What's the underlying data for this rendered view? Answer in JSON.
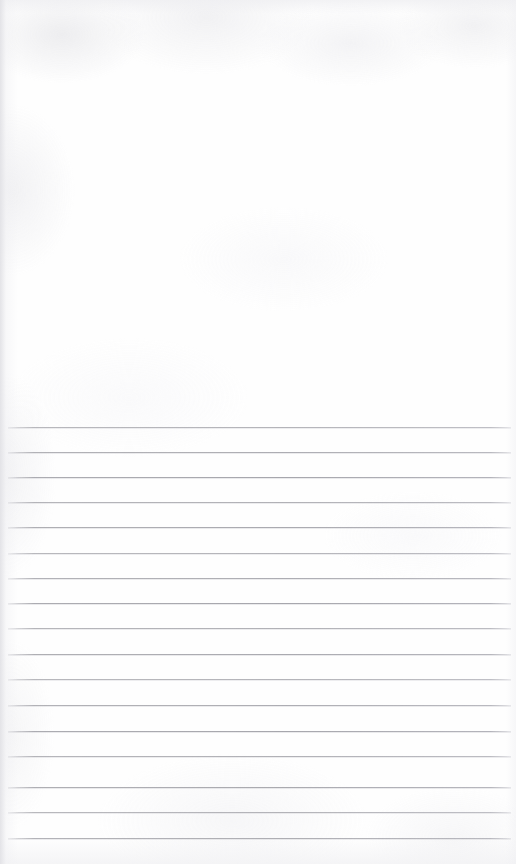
{
  "document": {
    "kind": "scanned-paper-sheet",
    "title": "Scanned ruled notebook page",
    "page_width": 516,
    "page_height": 864,
    "orientation": "portrait",
    "has_text": false,
    "has_handwriting": false,
    "has_vertical_margin_rule": false,
    "body_text": ""
  },
  "colors": {
    "paper": "#fefefe",
    "paper_shadow": "#e8e8ec",
    "rule_line": "#a2a2a8",
    "rule_line_soft": "#b6b6be",
    "edge_vignette": "#e2e2e6"
  },
  "regions": [
    {
      "name": "blank-upper-area",
      "label": "Blank unruled upper area",
      "top": 0,
      "height": 427
    },
    {
      "name": "ruled-area",
      "label": "Ruled writing area",
      "top": 427,
      "height": 437
    }
  ],
  "ruling": {
    "style": "horizontal-lines",
    "line_count": 17,
    "first_line_y": 427,
    "last_line_y": 838,
    "line_spacing": 25.7,
    "line_thickness": 1,
    "line_left_x": 8,
    "line_right_x": 511,
    "lines_y": [
      427,
      452,
      477,
      502,
      527,
      553,
      578,
      603,
      628,
      654,
      679,
      705,
      731,
      756,
      787,
      812,
      838
    ]
  }
}
